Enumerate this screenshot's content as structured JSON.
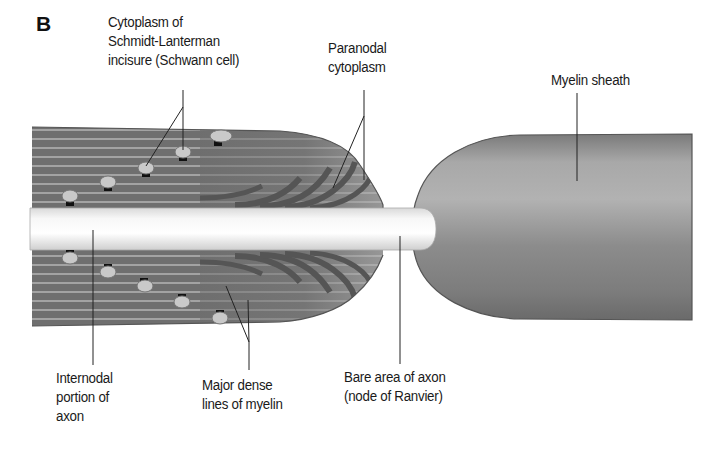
{
  "figure": {
    "panel_letter": "B"
  },
  "labels": {
    "cytoplasm_sl": [
      "Cytoplasm of",
      "Schmidt-Lanterman",
      "incisure (Schwann cell)"
    ],
    "paranodal": [
      "Paranodal",
      "cytoplasm"
    ],
    "myelin_sheath": [
      "Myelin sheath"
    ],
    "internodal": [
      "Internodal",
      "portion of",
      "axon"
    ],
    "major_dense": [
      "Major dense",
      "lines of myelin"
    ],
    "bare_area": [
      "Bare area of axon",
      "(node of Ranvier)"
    ]
  },
  "colors": {
    "myelin_dark": "#6e6e6e",
    "myelin_stripe": "#9a9a9a",
    "paranodal_light": "#b9b9b9",
    "axon": "#f2f2f2",
    "sheath": "#8f8f8f",
    "incisure_fill": "#c8c8c8",
    "leader": "#222222"
  }
}
